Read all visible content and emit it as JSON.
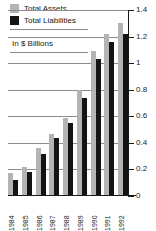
{
  "chart_data": {
    "type": "bar",
    "title": "",
    "subtitle": "",
    "units_note": "In $ Billions",
    "xlabel": "",
    "ylabel": "",
    "ylim": [
      0,
      1.4
    ],
    "ytick_labels": [
      "1.4",
      "1.2",
      "1",
      "0.8",
      "0.6",
      "0.4",
      "0.2",
      "0"
    ],
    "ytick_values": [
      1.4,
      1.2,
      1.0,
      0.8,
      0.6,
      0.4,
      0.2,
      0
    ],
    "grid": true,
    "grid_axis": "y",
    "legend_position": "top-left",
    "categories": [
      "1984",
      "1985",
      "1986",
      "1987",
      "1988",
      "1989",
      "1990",
      "1991",
      "1992"
    ],
    "series": [
      {
        "name": "Total Assets",
        "color": "#b4b4b4",
        "values": [
          0.17,
          0.22,
          0.36,
          0.47,
          0.59,
          0.8,
          1.09,
          1.22,
          1.3
        ]
      },
      {
        "name": "Total Liabilities",
        "color": "#141414",
        "values": [
          0.12,
          0.18,
          0.32,
          0.44,
          0.55,
          0.74,
          1.03,
          1.16,
          1.22
        ]
      }
    ]
  },
  "legend": {
    "items": [
      {
        "label": "Total Assets",
        "swatch": "assets"
      },
      {
        "label": "Total Liabilities",
        "swatch": "liab"
      }
    ]
  }
}
